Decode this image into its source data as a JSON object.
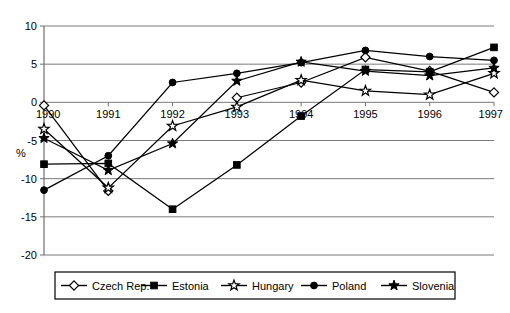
{
  "chart_data": {
    "type": "line",
    "title": "",
    "subtitle": "",
    "xlabel": "",
    "ylabel": "%",
    "x": [
      "1990",
      "1991",
      "1992",
      "1993",
      "1994",
      "1995",
      "1996",
      "1997"
    ],
    "categories": [
      "1990",
      "1991",
      "1992",
      "1993",
      "1994",
      "1995",
      "1996",
      "1997"
    ],
    "ylim": [
      -20,
      10
    ],
    "yticks": [
      10,
      5,
      0,
      -5,
      -10,
      -15,
      -20
    ],
    "ytick_labels": [
      "10",
      "5",
      "0",
      "-5",
      "-10",
      "-15",
      "-20"
    ],
    "grid": true,
    "grid_axis": "y",
    "legend_position": "bottom",
    "series": [
      {
        "name": "Czech Rep.",
        "marker": "open-diamond",
        "values": [
          -0.4,
          -11.6,
          null,
          0.6,
          2.6,
          5.9,
          4.1,
          1.3
        ]
      },
      {
        "name": "Estonia",
        "marker": "filled-square",
        "values": [
          -8.1,
          -8.0,
          -14.0,
          -8.2,
          -1.8,
          4.3,
          4.0,
          7.2
        ]
      },
      {
        "name": "Hungary",
        "marker": "open-star",
        "values": [
          -3.5,
          -11.2,
          -3.1,
          -0.6,
          2.9,
          1.5,
          1.0,
          3.8
        ]
      },
      {
        "name": "Poland",
        "marker": "filled-circle",
        "values": [
          -11.5,
          -7.0,
          2.6,
          3.8,
          5.2,
          6.8,
          6.0,
          5.5
        ]
      },
      {
        "name": "Slovenia",
        "marker": "filled-star",
        "values": [
          -4.7,
          -8.9,
          -5.4,
          2.8,
          5.3,
          4.1,
          3.5,
          4.5
        ]
      }
    ]
  },
  "legend": {
    "items": [
      {
        "label": "Czech Rep.",
        "marker": "open-diamond"
      },
      {
        "label": "Estonia",
        "marker": "filled-square"
      },
      {
        "label": "Hungary",
        "marker": "open-star"
      },
      {
        "label": "Poland",
        "marker": "filled-circle"
      },
      {
        "label": "Slovenia",
        "marker": "filled-star"
      }
    ]
  },
  "colors": {
    "line": "#000000",
    "grid": "#7a7a7a",
    "axis": "#6e6e6e",
    "background": "#ffffff",
    "marker_open_fill": "#ffffff"
  }
}
